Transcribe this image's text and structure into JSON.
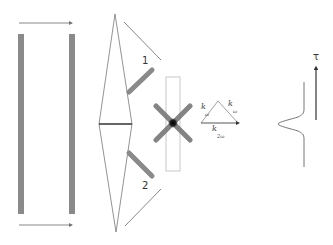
{
  "diagram": {
    "labels": {
      "beam_1": "1",
      "beam_2": "2",
      "k_omega_left": "k",
      "k_omega_left_sub": "ω",
      "k_omega_right": "k",
      "k_omega_right_sub": "ω",
      "k_2omega": "k",
      "k_2omega_sub": "2ω",
      "tau_axis": "τ"
    },
    "colors": {
      "bar": "#8a8a8a",
      "line": "#777777",
      "dark_line": "#333333",
      "crystal_border": "#bbbbbb",
      "focus_spot": "#111111"
    }
  }
}
